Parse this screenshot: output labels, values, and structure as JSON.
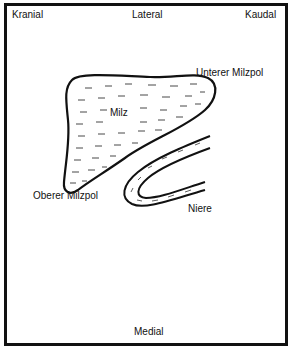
{
  "diagram": {
    "orientation_labels": {
      "top_left": "Kranial",
      "top_center": "Lateral",
      "top_right": "Kaudal",
      "bottom_center": "Medial"
    },
    "structures": {
      "spleen": "Milz",
      "upper_pole": "Unterer Milzpol",
      "lower_pole": "Oberer Milzpol",
      "kidney": "Niere"
    },
    "colors": {
      "stroke": "#111111",
      "background": "#ffffff"
    }
  }
}
